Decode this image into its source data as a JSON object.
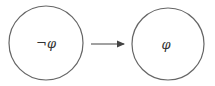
{
  "diagram": {
    "nodes": [
      {
        "id": "left",
        "label": "¬φ",
        "cx": 46,
        "cy": 43,
        "r": 37
      },
      {
        "id": "right",
        "label": "φ",
        "cx": 168,
        "cy": 44,
        "r": 36
      }
    ],
    "edges": [
      {
        "from": "left",
        "to": "right",
        "label": ""
      }
    ],
    "colors": {
      "stroke": "#555555",
      "background": "#ffffff"
    }
  }
}
